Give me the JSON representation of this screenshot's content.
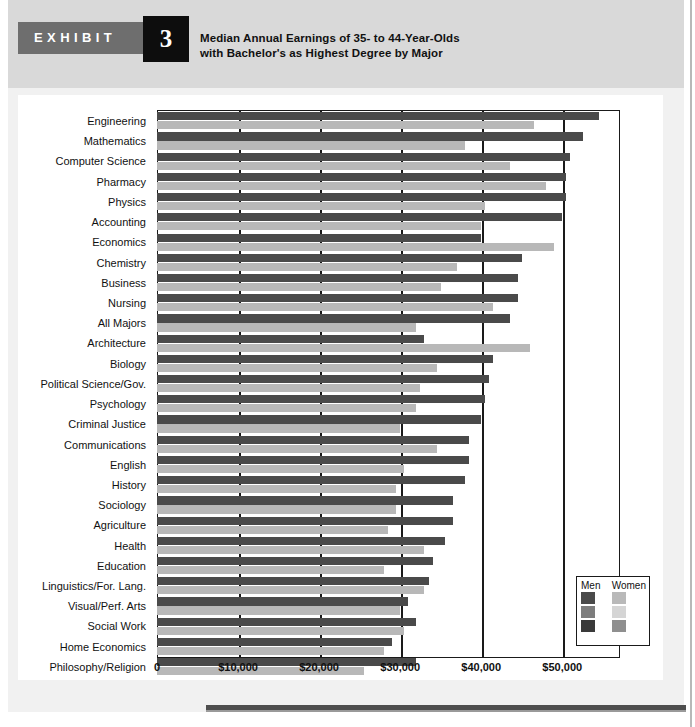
{
  "exhibit": {
    "word": "EXHIBIT",
    "number": "3",
    "title_line1": "Median Annual Earnings of 35- to 44-Year-Olds",
    "title_line2": "with Bachelor's as Highest Degree by Major"
  },
  "legend": {
    "men_label": "Men",
    "women_label": "Women",
    "men_colors": [
      "#4a4a4a",
      "#7d7d7d",
      "#3a3a3a"
    ],
    "women_colors": [
      "#b9b9b9",
      "#d5d5d5",
      "#8f8f8f"
    ]
  },
  "colors": {
    "men": "#4a4a4a",
    "women": "#b8b8b8",
    "axis": "#1a1a1a",
    "band": "#6e6e6e",
    "number_box": "#0d0d0d",
    "page_top": "#d9d9d9",
    "page_body": "#f1f1f1"
  },
  "chart_data": {
    "type": "bar",
    "orientation": "horizontal",
    "title": "Median Annual Earnings of 35- to 44-Year-Olds with Bachelor's as Highest Degree by Major",
    "xlabel": "",
    "ylabel": "",
    "xlim": [
      0,
      57000
    ],
    "grid": true,
    "legend_position": "bottom-right",
    "xticks": [
      0,
      10000,
      20000,
      30000,
      40000,
      50000
    ],
    "xticklabels": [
      "0",
      "$10,000",
      "$20,000",
      "$30,000",
      "$40,000",
      "$50,000"
    ],
    "categories": [
      "Engineering",
      "Mathematics",
      "Computer Science",
      "Pharmacy",
      "Physics",
      "Accounting",
      "Economics",
      "Chemistry",
      "Business",
      "Nursing",
      "All Majors",
      "Architecture",
      "Biology",
      "Political Science/Gov.",
      "Psychology",
      "Criminal Justice",
      "Communications",
      "English",
      "History",
      "Sociology",
      "Agriculture",
      "Health",
      "Education",
      "Linguistics/For. Lang.",
      "Visual/Perf. Arts",
      "Social Work",
      "Home Economics",
      "Philosophy/Religion"
    ],
    "series": [
      {
        "name": "Men",
        "color": "#4a4a4a",
        "values": [
          54500,
          52500,
          51000,
          50500,
          50500,
          50000,
          40000,
          45000,
          44500,
          44500,
          43500,
          33000,
          41500,
          41000,
          40500,
          40000,
          38500,
          38500,
          38000,
          36500,
          36500,
          35500,
          34000,
          33500,
          31000,
          32000,
          29000,
          32000
        ]
      },
      {
        "name": "Women",
        "color": "#b8b8b8",
        "values": [
          46500,
          38000,
          43500,
          48000,
          40500,
          40000,
          49000,
          37000,
          35000,
          41500,
          32000,
          46000,
          34500,
          32500,
          32000,
          30000,
          34500,
          30500,
          29500,
          29500,
          28500,
          33000,
          28000,
          33000,
          30000,
          30500,
          28000,
          25500
        ]
      }
    ]
  }
}
